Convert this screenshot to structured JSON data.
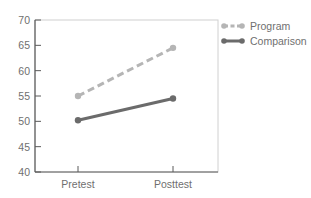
{
  "chart_data": {
    "type": "line",
    "title": "",
    "xlabel": "",
    "ylabel": "",
    "categories": [
      "Pretest",
      "Posttest"
    ],
    "series": [
      {
        "name": "Program",
        "values": [
          55,
          64.5
        ],
        "color": "#b5b5b5",
        "style": "dashed"
      },
      {
        "name": "Comparison",
        "values": [
          50.2,
          54.5
        ],
        "color": "#6b6b6b",
        "style": "solid"
      }
    ],
    "ylim": [
      40,
      70
    ],
    "yticks": [
      "40",
      "45",
      "50",
      "55",
      "60",
      "65",
      "70"
    ],
    "grid": false,
    "legend_position": "right-top"
  },
  "legend": {
    "items": [
      "Program",
      "Comparison"
    ]
  }
}
